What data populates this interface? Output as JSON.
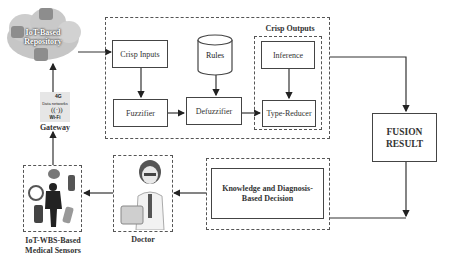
{
  "repository": {
    "label_line1": "IoT-Based",
    "label_line2": "Repository"
  },
  "gateway": {
    "top_text": "4G",
    "networks_text": "Data networks",
    "wifi_text": "Wi-Fi",
    "label": "Gateway"
  },
  "processing": {
    "crisp_inputs": "Crisp Inputs",
    "rules": "Rules",
    "crisp_outputs": "Crisp Outputs",
    "inference": "Inference",
    "fuzzifier": "Fuzzifier",
    "defuzzifier": "Defuzzifier",
    "type_reducer": "Type-Reducer"
  },
  "fusion": {
    "line1": "FUSION",
    "line2": "RESULT"
  },
  "decision": {
    "line1": "Knowledge and Diagnosis-",
    "line2": "Based Decision"
  },
  "doctor": {
    "label": "Doctor"
  },
  "sensors": {
    "label_line1": "IoT-WBS-Based",
    "label_line2": "Medical Sensors"
  },
  "colors": {
    "line": "#333333",
    "border": "#444444",
    "cloud": "#c9c9c9",
    "background": "#ffffff"
  }
}
